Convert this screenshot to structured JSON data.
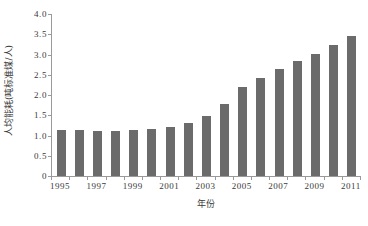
{
  "chart_data": {
    "type": "bar",
    "title": "",
    "xlabel": "年份",
    "ylabel": "人均能耗(吨标准煤/人)",
    "categories": [
      "1995",
      "1996",
      "1997",
      "1998",
      "1999",
      "2000",
      "2001",
      "2002",
      "2003",
      "2004",
      "2005",
      "2006",
      "2007",
      "2008",
      "2009",
      "2010",
      "2011"
    ],
    "values": [
      1.14,
      1.14,
      1.11,
      1.12,
      1.14,
      1.17,
      1.2,
      1.3,
      1.47,
      1.79,
      2.2,
      2.43,
      2.65,
      2.83,
      3.01,
      3.24,
      3.45
    ],
    "x_tick_labels": [
      "1995",
      "1997",
      "1999",
      "2001",
      "2003",
      "2005",
      "2007",
      "2009",
      "2011"
    ],
    "x_tick_categories": [
      "1995",
      "1997",
      "1999",
      "2001",
      "2003",
      "2005",
      "2007",
      "2009",
      "2011"
    ],
    "y_tick_labels": [
      "4.0",
      "3.5",
      "3.0",
      "2.5",
      "2.0",
      "1.5",
      "1.0",
      "0.5",
      "0"
    ],
    "y_tick_values": [
      4.0,
      3.5,
      3.0,
      2.5,
      2.0,
      1.5,
      1.0,
      0.5,
      0
    ],
    "ylim": [
      0,
      4.0
    ],
    "grid": false,
    "legend": false,
    "bar_color": "#6b6b6b",
    "axis_color": "#9a9a9a",
    "text_color": "#3a3a3a",
    "background": "#ffffff"
  }
}
